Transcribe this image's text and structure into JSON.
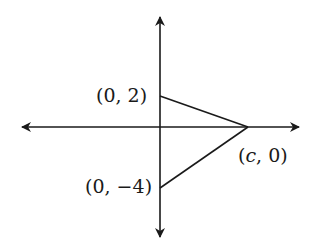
{
  "diagram": {
    "type": "coordinate-triangle",
    "stroke_color": "#1a1a1a",
    "axes": {
      "x_axis": {
        "from": [
          21,
          127
        ],
        "to": [
          300,
          127
        ],
        "arrows": "both"
      },
      "y_axis": {
        "from": [
          160,
          16
        ],
        "to": [
          160,
          238
        ],
        "arrows": "both"
      }
    },
    "points": [
      {
        "id": "A",
        "coords": "(0, 2)",
        "px": [
          160,
          96
        ]
      },
      {
        "id": "B",
        "coords": "(c, 0)",
        "px": [
          248,
          127
        ]
      },
      {
        "id": "C",
        "coords": "(0, -4)",
        "px": [
          160,
          188
        ]
      }
    ],
    "labels": {
      "point_a": {
        "open": "(",
        "x": "0",
        "sep": ", ",
        "y": "2",
        "close": ")"
      },
      "point_b": {
        "open": "(",
        "x": "c",
        "sep": ", ",
        "y": "0",
        "close": ")"
      },
      "point_c": {
        "open": "(",
        "x": "0",
        "sep": ", ",
        "y": "−4",
        "close": ")"
      }
    }
  }
}
